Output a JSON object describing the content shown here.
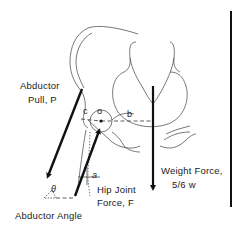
{
  "diagram": {
    "labels": {
      "abductor_pull_line1": "Abductor",
      "abductor_pull_line2": "Pull, P",
      "lever_c": "c",
      "joint_center_o": "o",
      "lever_b": "b",
      "angle_a": "a",
      "hip_joint_force_line1": "Hip Joint",
      "hip_joint_force_line2": "Force, F",
      "weight_force_line1": "Weight Force,",
      "weight_force_line2": "5/6 w",
      "abductor_angle": "Abductor Angle",
      "theta": "θ"
    },
    "forces": [
      {
        "name": "Abductor Pull",
        "symbol": "P"
      },
      {
        "name": "Hip Joint Force",
        "symbol": "F"
      },
      {
        "name": "Weight Force",
        "symbol": "5/6 w"
      }
    ],
    "colors": {
      "ink": "#111111",
      "outline": "#555555",
      "background": "#ffffff"
    }
  }
}
